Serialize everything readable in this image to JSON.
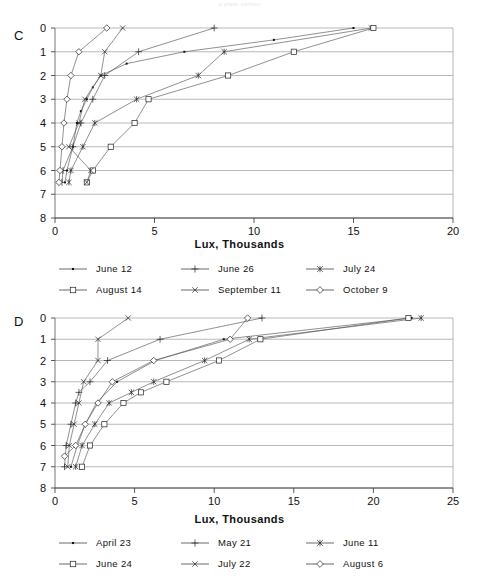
{
  "caption_top": "a plate carbon",
  "panels": [
    {
      "letter": "C",
      "x_axis": {
        "label": "Lux, Thousands",
        "ticks": [
          0,
          5,
          10,
          15,
          20
        ],
        "min": 0,
        "max": 20
      },
      "y_axis": {
        "label": "",
        "ticks": [
          0,
          1,
          2,
          3,
          4,
          5,
          6,
          7,
          8
        ],
        "min": 0,
        "max": 8
      },
      "legend": [
        {
          "label": "June 12",
          "marker": "dot"
        },
        {
          "label": "June 26",
          "marker": "plus"
        },
        {
          "label": "July 24",
          "marker": "asterisk"
        },
        {
          "label": "August 14",
          "marker": "square"
        },
        {
          "label": "September 11",
          "marker": "star"
        },
        {
          "label": "October 9",
          "marker": "diamond"
        }
      ]
    },
    {
      "letter": "D",
      "x_axis": {
        "label": "Lux, Thousands",
        "ticks": [
          0,
          5,
          10,
          15,
          20,
          25
        ],
        "min": 0,
        "max": 25
      },
      "y_axis": {
        "label": "",
        "ticks": [
          0,
          1,
          2,
          3,
          4,
          5,
          6,
          7,
          8
        ],
        "min": 0,
        "max": 8
      },
      "legend": [
        {
          "label": "April 23",
          "marker": "dot"
        },
        {
          "label": "May 21",
          "marker": "plus"
        },
        {
          "label": "June 11",
          "marker": "asterisk"
        },
        {
          "label": "June 24",
          "marker": "square"
        },
        {
          "label": "July 22",
          "marker": "star"
        },
        {
          "label": "August 6",
          "marker": "diamond"
        }
      ]
    }
  ],
  "chart_data": [
    {
      "type": "line",
      "panel": "C",
      "title": "",
      "xlabel": "Lux, Thousands",
      "ylabel": "Depth",
      "xlim": [
        0,
        20
      ],
      "ylim": [
        0,
        8
      ],
      "y_inverted": true,
      "grid": true,
      "legend_position": "below",
      "series": [
        {
          "name": "June 12",
          "marker": "dot",
          "points": [
            {
              "x": 15.0,
              "y": 0.0
            },
            {
              "x": 11.0,
              "y": 0.5
            },
            {
              "x": 6.5,
              "y": 1.0
            },
            {
              "x": 3.6,
              "y": 1.5
            },
            {
              "x": 2.3,
              "y": 2.0
            },
            {
              "x": 1.9,
              "y": 2.5
            },
            {
              "x": 1.6,
              "y": 3.0
            },
            {
              "x": 1.3,
              "y": 3.5
            },
            {
              "x": 1.1,
              "y": 4.0
            },
            {
              "x": 0.9,
              "y": 5.0
            },
            {
              "x": 0.6,
              "y": 6.0
            },
            {
              "x": 0.5,
              "y": 6.5
            }
          ]
        },
        {
          "name": "June 26",
          "marker": "plus",
          "points": [
            {
              "x": 8.0,
              "y": 0.0
            },
            {
              "x": 4.2,
              "y": 1.0
            },
            {
              "x": 2.5,
              "y": 2.0
            },
            {
              "x": 1.9,
              "y": 3.0
            },
            {
              "x": 1.3,
              "y": 4.0
            },
            {
              "x": 0.9,
              "y": 5.0
            },
            {
              "x": 0.4,
              "y": 6.0
            },
            {
              "x": 0.35,
              "y": 6.5
            }
          ]
        },
        {
          "name": "July 24",
          "marker": "asterisk",
          "points": [
            {
              "x": 15.9,
              "y": 0.0
            },
            {
              "x": 8.5,
              "y": 1.0
            },
            {
              "x": 7.2,
              "y": 2.0
            },
            {
              "x": 4.1,
              "y": 3.0
            },
            {
              "x": 2.0,
              "y": 4.0
            },
            {
              "x": 1.4,
              "y": 5.0
            },
            {
              "x": 0.8,
              "y": 6.0
            },
            {
              "x": 0.7,
              "y": 6.5
            }
          ]
        },
        {
          "name": "August 14",
          "marker": "square",
          "points": [
            {
              "x": 16.0,
              "y": 0.0
            },
            {
              "x": 12.0,
              "y": 1.0
            },
            {
              "x": 8.7,
              "y": 2.0
            },
            {
              "x": 4.7,
              "y": 3.0
            },
            {
              "x": 4.0,
              "y": 4.0
            },
            {
              "x": 2.8,
              "y": 5.0
            },
            {
              "x": 1.9,
              "y": 6.0
            },
            {
              "x": 1.6,
              "y": 6.5
            }
          ]
        },
        {
          "name": "September 11",
          "marker": "star",
          "points": [
            {
              "x": 3.4,
              "y": 0.0
            },
            {
              "x": 2.5,
              "y": 1.0
            },
            {
              "x": 2.3,
              "y": 2.0
            },
            {
              "x": 1.5,
              "y": 3.0
            },
            {
              "x": 1.2,
              "y": 4.0
            },
            {
              "x": 0.7,
              "y": 5.0
            },
            {
              "x": 1.8,
              "y": 6.0
            },
            {
              "x": 1.6,
              "y": 6.5
            }
          ]
        },
        {
          "name": "October 9",
          "marker": "diamond",
          "points": [
            {
              "x": 2.6,
              "y": 0.0
            },
            {
              "x": 1.2,
              "y": 1.0
            },
            {
              "x": 0.8,
              "y": 2.0
            },
            {
              "x": 0.6,
              "y": 3.0
            },
            {
              "x": 0.45,
              "y": 4.0
            },
            {
              "x": 0.35,
              "y": 5.0
            },
            {
              "x": 0.25,
              "y": 6.0
            },
            {
              "x": 0.2,
              "y": 6.5
            }
          ]
        }
      ]
    },
    {
      "type": "line",
      "panel": "D",
      "title": "",
      "xlabel": "Lux, Thousands",
      "ylabel": "Depth",
      "xlim": [
        0,
        25
      ],
      "ylim": [
        0,
        8
      ],
      "y_inverted": true,
      "grid": true,
      "legend_position": "below",
      "series": [
        {
          "name": "April 23",
          "marker": "dot",
          "points": [
            {
              "x": 22.4,
              "y": 0.0
            },
            {
              "x": 10.6,
              "y": 1.0
            },
            {
              "x": 6.3,
              "y": 2.0
            },
            {
              "x": 3.9,
              "y": 3.0
            },
            {
              "x": 2.6,
              "y": 4.0
            },
            {
              "x": 1.9,
              "y": 5.0
            },
            {
              "x": 1.4,
              "y": 6.0
            },
            {
              "x": 1.0,
              "y": 7.0
            }
          ]
        },
        {
          "name": "May 21",
          "marker": "plus",
          "points": [
            {
              "x": 13.0,
              "y": 0.0
            },
            {
              "x": 6.6,
              "y": 1.0
            },
            {
              "x": 3.3,
              "y": 2.0
            },
            {
              "x": 2.2,
              "y": 3.0
            },
            {
              "x": 1.5,
              "y": 3.5
            },
            {
              "x": 1.3,
              "y": 4.0
            },
            {
              "x": 1.0,
              "y": 5.0
            },
            {
              "x": 0.7,
              "y": 6.0
            },
            {
              "x": 0.6,
              "y": 7.0
            }
          ]
        },
        {
          "name": "June 11",
          "marker": "asterisk",
          "points": [
            {
              "x": 23.0,
              "y": 0.0
            },
            {
              "x": 12.2,
              "y": 1.0
            },
            {
              "x": 9.4,
              "y": 2.0
            },
            {
              "x": 6.2,
              "y": 3.0
            },
            {
              "x": 4.8,
              "y": 3.5
            },
            {
              "x": 3.4,
              "y": 4.0
            },
            {
              "x": 2.5,
              "y": 5.0
            },
            {
              "x": 1.7,
              "y": 6.0
            },
            {
              "x": 1.3,
              "y": 7.0
            }
          ]
        },
        {
          "name": "June 24",
          "marker": "square",
          "points": [
            {
              "x": 22.2,
              "y": 0.0
            },
            {
              "x": 12.9,
              "y": 1.0
            },
            {
              "x": 10.3,
              "y": 2.0
            },
            {
              "x": 7.0,
              "y": 3.0
            },
            {
              "x": 5.4,
              "y": 3.5
            },
            {
              "x": 4.3,
              "y": 4.0
            },
            {
              "x": 3.1,
              "y": 5.0
            },
            {
              "x": 2.2,
              "y": 6.0
            },
            {
              "x": 1.7,
              "y": 7.0
            }
          ]
        },
        {
          "name": "July 22",
          "marker": "star",
          "points": [
            {
              "x": 4.6,
              "y": 0.0
            },
            {
              "x": 2.7,
              "y": 1.0
            },
            {
              "x": 2.7,
              "y": 2.0
            },
            {
              "x": 1.8,
              "y": 3.0
            },
            {
              "x": 1.5,
              "y": 4.0
            },
            {
              "x": 1.2,
              "y": 5.0
            },
            {
              "x": 0.9,
              "y": 6.0
            },
            {
              "x": 0.8,
              "y": 7.0
            }
          ]
        },
        {
          "name": "August 6",
          "marker": "diamond",
          "points": [
            {
              "x": 12.1,
              "y": 0.0
            },
            {
              "x": 11.0,
              "y": 1.0
            },
            {
              "x": 6.2,
              "y": 2.0
            },
            {
              "x": 3.6,
              "y": 3.0
            },
            {
              "x": 2.7,
              "y": 4.0
            },
            {
              "x": 1.9,
              "y": 5.0
            },
            {
              "x": 1.3,
              "y": 6.0
            },
            {
              "x": 0.6,
              "y": 6.5
            }
          ]
        }
      ]
    }
  ]
}
